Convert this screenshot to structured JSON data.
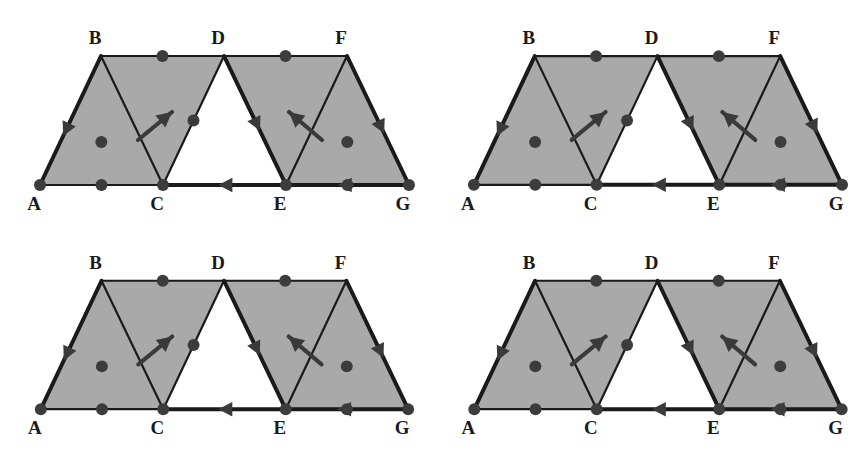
{
  "figure": {
    "panel_count": 4,
    "background_color": "#ffffff"
  },
  "style": {
    "face_fill": "#a9a9a9",
    "face_fill_edge_noise": "#a3a3a3",
    "hole_fill": "#ffffff",
    "edge_color": "#1a1a1a",
    "dot_color": "#3c3c3c",
    "arrow_color": "#3a3a3a",
    "highlight_color": "#dcdcdc",
    "highlight_opacity": 0.85,
    "label_color": "#1a1a1a",
    "edge_width": 2.2,
    "bold_edge_width": 4.0,
    "highlight_width": 11,
    "dot_radius": 6.0
  },
  "geometry": {
    "vertices": [
      {
        "id": "A",
        "x": 40,
        "y": 185,
        "label": "A",
        "label_x": 34,
        "label_y": 210
      },
      {
        "id": "B",
        "x": 101,
        "y": 56,
        "label": "B",
        "label_x": 95,
        "label_y": 44
      },
      {
        "id": "C",
        "x": 163,
        "y": 185,
        "label": "C",
        "label_x": 157,
        "label_y": 210
      },
      {
        "id": "D",
        "x": 224,
        "y": 56,
        "label": "D",
        "label_x": 218,
        "label_y": 44
      },
      {
        "id": "E",
        "x": 286,
        "y": 185,
        "label": "E",
        "label_x": 280,
        "label_y": 210
      },
      {
        "id": "F",
        "x": 347,
        "y": 56,
        "label": "F",
        "label_x": 341,
        "label_y": 44
      },
      {
        "id": "G",
        "x": 409,
        "y": 185,
        "label": "G",
        "label_x": 403,
        "label_y": 210
      }
    ],
    "edges": [
      {
        "id": "AB",
        "from": "A",
        "to": "B"
      },
      {
        "id": "BC",
        "from": "B",
        "to": "C"
      },
      {
        "id": "AC",
        "from": "A",
        "to": "C"
      },
      {
        "id": "BD",
        "from": "B",
        "to": "D"
      },
      {
        "id": "CD",
        "from": "C",
        "to": "D"
      },
      {
        "id": "DE",
        "from": "D",
        "to": "E"
      },
      {
        "id": "CE",
        "from": "C",
        "to": "E"
      },
      {
        "id": "DF",
        "from": "D",
        "to": "F"
      },
      {
        "id": "EF",
        "from": "E",
        "to": "F"
      },
      {
        "id": "FG",
        "from": "F",
        "to": "G"
      },
      {
        "id": "EG",
        "from": "E",
        "to": "G"
      }
    ],
    "filled_faces": [
      {
        "id": "ABC",
        "vertices": [
          "A",
          "B",
          "C"
        ]
      },
      {
        "id": "BCD",
        "vertices": [
          "B",
          "C",
          "D"
        ]
      },
      {
        "id": "DEF",
        "vertices": [
          "D",
          "E",
          "F"
        ]
      },
      {
        "id": "EFG",
        "vertices": [
          "E",
          "F",
          "G"
        ]
      }
    ],
    "hole_faces": [
      {
        "id": "CDE",
        "vertices": [
          "C",
          "D",
          "E"
        ]
      }
    ],
    "edge_midpoint_dots": [
      "AC",
      "BD",
      "CD",
      "DF",
      "EG"
    ],
    "face_center_dots": [
      "ABC",
      "EFG"
    ],
    "vertex_dots": [
      "A",
      "C",
      "E",
      "G"
    ],
    "bold_oriented_edges": [
      {
        "id": "AB",
        "from": "B",
        "to": "A",
        "arrow_at": 0.62
      },
      {
        "id": "DE",
        "from": "D",
        "to": "E",
        "arrow_at": 0.58
      },
      {
        "id": "FG",
        "from": "F",
        "to": "G",
        "arrow_at": 0.6
      },
      {
        "id": "CE",
        "from": "E",
        "to": "C",
        "arrow_at": 0.55
      },
      {
        "id": "EG",
        "from": "G",
        "to": "E",
        "arrow_at": 0.58
      }
    ],
    "free_arrows": [
      {
        "id": "arrow-bc",
        "x1": 138,
        "y1": 140,
        "x2": 172,
        "y2": 112,
        "direction": "up-right"
      },
      {
        "id": "arrow-ef",
        "x1": 322,
        "y1": 140,
        "x2": 289,
        "y2": 112,
        "direction": "up-left"
      }
    ]
  },
  "panels": [
    {
      "id": "panel-top-left",
      "index": 1,
      "highlight_name": "cycle-A-B-D-E-C",
      "highlight_path": [
        "A",
        "B",
        "D",
        "E",
        "C",
        "A"
      ],
      "highlight_closed": true,
      "description": "Highlighted parallelogram boundary A-B-D-E-C-A spanning the left two triangles and the hole's left side"
    },
    {
      "id": "panel-top-right",
      "index": 2,
      "highlight_name": "cycle-D-F-G-E",
      "highlight_path": [
        "D",
        "F",
        "G",
        "E",
        "D"
      ],
      "highlight_closed": true,
      "description": "Highlighted parallelogram boundary D-F-G-E-D spanning the right two triangles"
    },
    {
      "id": "panel-bottom-left",
      "index": 3,
      "highlight_name": "segment-A-C",
      "highlight_path": [
        "A",
        "C"
      ],
      "highlight_closed": false,
      "description": "Highlighted bottom-left base segment from A to C only"
    },
    {
      "id": "panel-bottom-right",
      "index": 4,
      "highlight_name": "cycle-C-D-E",
      "highlight_path": [
        "C",
        "D",
        "E",
        "C"
      ],
      "highlight_closed": true,
      "description": "Highlighted inverted triangle boundary C-D-E-C around the white hole"
    }
  ]
}
